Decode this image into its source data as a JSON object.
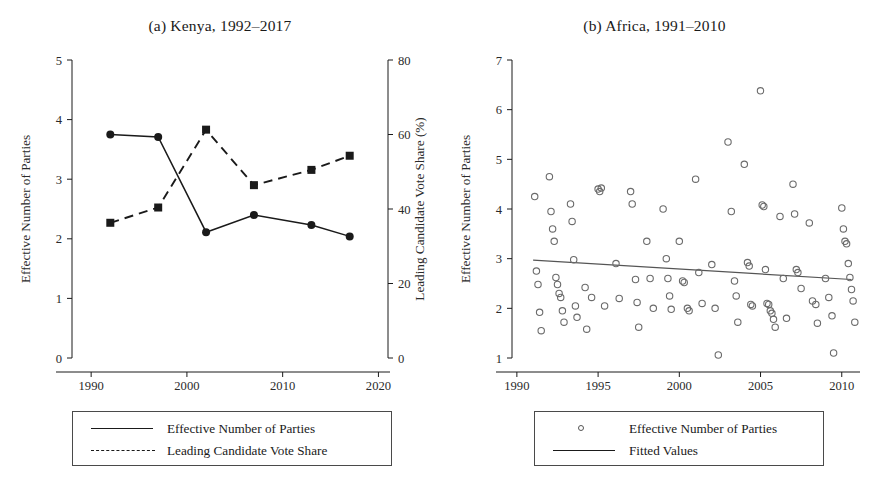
{
  "figure": {
    "background": "#ffffff",
    "ink_color": "#1a1a1a",
    "marker_color": "#111111",
    "scatter_color": "#6b6b6b"
  },
  "panels": [
    {
      "id": "a",
      "title": "(a) Kenya, 1992–2017",
      "left_axis": {
        "label": "Effective Number of Parties",
        "ticks": [
          "0",
          "1",
          "2",
          "3",
          "4",
          "5"
        ],
        "min": 0,
        "max": 5
      },
      "right_axis": {
        "label": "Leading Candidate Vote Share (%)",
        "ticks": [
          "0",
          "20",
          "40",
          "60",
          "80"
        ],
        "min": 0,
        "max": 80
      },
      "x_axis": {
        "ticks": [
          "1990",
          "2000",
          "2010",
          "2020"
        ],
        "min": 1988,
        "max": 2021
      },
      "legend": [
        {
          "key": "solid-line",
          "label": "Effective Number of Parties"
        },
        {
          "key": "dashed-line",
          "label": "Leading Candidate Vote Share"
        }
      ]
    },
    {
      "id": "b",
      "title": "(b) Africa, 1991–2010",
      "left_axis": {
        "label": "Effective Number of Parties",
        "ticks": [
          "1",
          "2",
          "3",
          "4",
          "5",
          "6",
          "7"
        ],
        "min": 1,
        "max": 7
      },
      "x_axis": {
        "ticks": [
          "1990",
          "1995",
          "2000",
          "2005",
          "2010"
        ],
        "min": 1989.7,
        "max": 2011.0
      },
      "legend": [
        {
          "key": "open-circle",
          "label": "Effective Number of Parties"
        },
        {
          "key": "solid-line",
          "label": "Fitted Values"
        }
      ]
    }
  ],
  "chart_data": [
    {
      "type": "line",
      "panel": "a",
      "title": "(a) Kenya, 1992–2017",
      "xlabel": "",
      "ylabel": "Effective Number of Parties",
      "y2label": "Leading Candidate Vote Share (%)",
      "xlim": [
        1988,
        2021
      ],
      "ylim": [
        0,
        5
      ],
      "y2lim": [
        0,
        80
      ],
      "xticks": [
        1990,
        2000,
        2010,
        2020
      ],
      "yticks": [
        0,
        1,
        2,
        3,
        4,
        5
      ],
      "y2ticks": [
        0,
        20,
        40,
        60,
        80
      ],
      "grid": false,
      "legend_position": "below",
      "x": [
        1992,
        1997,
        2002,
        2007,
        2013,
        2017
      ],
      "series": [
        {
          "name": "Effective Number of Parties",
          "axis": "left",
          "style": "solid",
          "marker": "filled-circle",
          "values": [
            3.75,
            3.71,
            2.11,
            2.4,
            2.23,
            2.04
          ]
        },
        {
          "name": "Leading Candidate Vote Share",
          "axis": "right",
          "style": "dashed",
          "marker": "filled-square",
          "values": [
            36.3,
            40.4,
            61.3,
            46.4,
            50.5,
            54.3
          ]
        }
      ]
    },
    {
      "type": "scatter",
      "panel": "b",
      "title": "(b) Africa, 1991–2010",
      "xlabel": "",
      "ylabel": "Effective Number of Parties",
      "xlim": [
        1989.7,
        2011.0
      ],
      "ylim": [
        1,
        7
      ],
      "xticks": [
        1990,
        1995,
        2000,
        2005,
        2010
      ],
      "yticks": [
        1,
        2,
        3,
        4,
        5,
        6,
        7
      ],
      "grid": false,
      "legend_position": "below",
      "series": [
        {
          "name": "Effective Number of Parties",
          "marker": "open-circle",
          "points": [
            [
              1991.1,
              4.25
            ],
            [
              1991.2,
              2.75
            ],
            [
              1991.3,
              2.48
            ],
            [
              1991.4,
              1.92
            ],
            [
              1991.5,
              1.55
            ],
            [
              1992.0,
              4.65
            ],
            [
              1992.1,
              3.95
            ],
            [
              1992.2,
              3.6
            ],
            [
              1992.3,
              3.35
            ],
            [
              1992.4,
              2.62
            ],
            [
              1992.5,
              2.48
            ],
            [
              1992.6,
              2.3
            ],
            [
              1992.7,
              2.22
            ],
            [
              1992.8,
              1.95
            ],
            [
              1992.9,
              1.72
            ],
            [
              1993.3,
              4.1
            ],
            [
              1993.4,
              3.75
            ],
            [
              1993.5,
              2.98
            ],
            [
              1993.6,
              2.05
            ],
            [
              1993.7,
              1.82
            ],
            [
              1994.2,
              2.42
            ],
            [
              1994.3,
              1.58
            ],
            [
              1994.6,
              2.22
            ],
            [
              1995.0,
              4.4
            ],
            [
              1995.1,
              4.35
            ],
            [
              1995.2,
              4.42
            ],
            [
              1995.4,
              2.05
            ],
            [
              1996.1,
              2.9
            ],
            [
              1996.3,
              2.2
            ],
            [
              1997.0,
              4.35
            ],
            [
              1997.1,
              4.1
            ],
            [
              1997.3,
              2.58
            ],
            [
              1997.4,
              2.12
            ],
            [
              1997.5,
              1.62
            ],
            [
              1998.0,
              3.35
            ],
            [
              1998.2,
              2.6
            ],
            [
              1998.4,
              2.0
            ],
            [
              1999.0,
              4.0
            ],
            [
              1999.2,
              3.0
            ],
            [
              1999.3,
              2.6
            ],
            [
              1999.4,
              2.25
            ],
            [
              1999.5,
              1.98
            ],
            [
              2000.0,
              3.35
            ],
            [
              2000.2,
              2.55
            ],
            [
              2000.3,
              2.52
            ],
            [
              2000.5,
              2.0
            ],
            [
              2000.6,
              1.95
            ],
            [
              2001.0,
              4.6
            ],
            [
              2001.2,
              2.72
            ],
            [
              2001.4,
              2.1
            ],
            [
              2002.0,
              2.88
            ],
            [
              2002.2,
              2.0
            ],
            [
              2002.4,
              1.06
            ],
            [
              2003.0,
              5.35
            ],
            [
              2003.2,
              3.95
            ],
            [
              2003.4,
              2.55
            ],
            [
              2003.5,
              2.25
            ],
            [
              2003.6,
              1.72
            ],
            [
              2004.0,
              4.9
            ],
            [
              2004.2,
              2.92
            ],
            [
              2004.3,
              2.85
            ],
            [
              2004.4,
              2.08
            ],
            [
              2004.5,
              2.05
            ],
            [
              2005.0,
              6.38
            ],
            [
              2005.1,
              4.08
            ],
            [
              2005.2,
              4.05
            ],
            [
              2005.3,
              2.78
            ],
            [
              2005.4,
              2.1
            ],
            [
              2005.5,
              2.08
            ],
            [
              2005.6,
              1.95
            ],
            [
              2005.7,
              1.9
            ],
            [
              2005.8,
              1.78
            ],
            [
              2005.9,
              1.62
            ],
            [
              2006.2,
              3.85
            ],
            [
              2006.4,
              2.6
            ],
            [
              2006.6,
              1.8
            ],
            [
              2007.0,
              4.5
            ],
            [
              2007.1,
              3.9
            ],
            [
              2007.2,
              2.78
            ],
            [
              2007.3,
              2.72
            ],
            [
              2007.5,
              2.4
            ],
            [
              2008.0,
              3.72
            ],
            [
              2008.2,
              2.15
            ],
            [
              2008.4,
              2.08
            ],
            [
              2008.5,
              1.7
            ],
            [
              2009.0,
              2.6
            ],
            [
              2009.2,
              2.22
            ],
            [
              2009.4,
              1.85
            ],
            [
              2009.5,
              1.1
            ],
            [
              2010.0,
              4.02
            ],
            [
              2010.1,
              3.6
            ],
            [
              2010.2,
              3.35
            ],
            [
              2010.3,
              3.3
            ],
            [
              2010.4,
              2.9
            ],
            [
              2010.5,
              2.62
            ],
            [
              2010.6,
              2.38
            ],
            [
              2010.7,
              2.15
            ],
            [
              2010.8,
              1.72
            ]
          ]
        },
        {
          "name": "Fitted Values",
          "marker": "none",
          "style": "solid",
          "endpoints": [
            [
              1991.0,
              2.97
            ],
            [
              2010.6,
              2.58
            ]
          ]
        }
      ]
    }
  ]
}
